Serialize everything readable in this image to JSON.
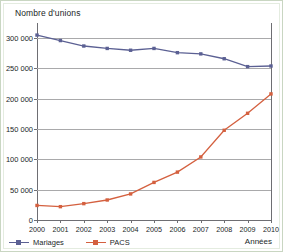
{
  "chart_data": {
    "type": "line",
    "title": "Nombre d'unions",
    "xlabel": "Années",
    "ylabel": "Nombre d'unions",
    "categories": [
      "2000",
      "2001",
      "2002",
      "2003",
      "2004",
      "2005",
      "2006",
      "2007",
      "2008",
      "2009",
      "2010"
    ],
    "x": [
      2000,
      2001,
      2002,
      2003,
      2004,
      2005,
      2006,
      2007,
      2008,
      2009,
      2010
    ],
    "ylim": [
      0,
      320000
    ],
    "xlim": [
      2000,
      2010
    ],
    "yticks": [
      0,
      50000,
      100000,
      150000,
      200000,
      250000,
      300000
    ],
    "ytick_labels": [
      "0",
      "50 000",
      "100 000",
      "150 000",
      "200 000",
      "250 000",
      "300 000"
    ],
    "grid": true,
    "legend_position": "bottom-left",
    "series": [
      {
        "name": "Mariages",
        "color": "#5b6093",
        "marker": "square",
        "values": [
          305000,
          296000,
          287000,
          283000,
          280000,
          283000,
          276000,
          274000,
          266000,
          253000,
          254000
        ]
      },
      {
        "name": "PACS",
        "color": "#d4603f",
        "marker": "square",
        "values": [
          24000,
          22000,
          27000,
          33000,
          43000,
          62000,
          79000,
          104000,
          148000,
          176000,
          208000
        ]
      }
    ]
  },
  "legend": {
    "items": [
      {
        "label": "Mariages",
        "color": "#5b6093"
      },
      {
        "label": "PACS",
        "color": "#d4603f"
      }
    ]
  },
  "axes": {
    "y_title": "Nombre d'unions",
    "x_title": "Années"
  },
  "colors": {
    "mariages": "#5b6093",
    "pacs": "#d4603f",
    "grid": "#a9a9ab",
    "axis": "#6e6e73",
    "frame": "#c9d6c2",
    "text": "#221f1f"
  }
}
